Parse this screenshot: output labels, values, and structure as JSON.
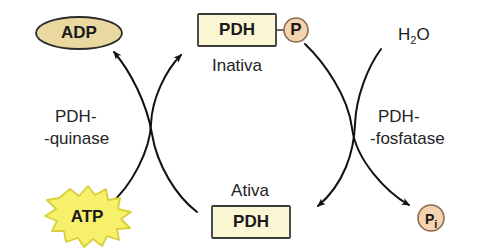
{
  "diagram": {
    "language": "pt-BR",
    "background_color": "#ffffff",
    "nodes": {
      "adp": {
        "label": "ADP",
        "shape": "ellipse",
        "fill": "#e9d8a0",
        "stroke": "#2b2b2b"
      },
      "atp": {
        "label": "ATP",
        "shape": "starburst",
        "fill": "#f7f06a",
        "stroke": "#d8cf3a"
      },
      "pdh_inactive": {
        "label": "PDH",
        "shape": "rect",
        "fill": "#fbf6d4",
        "stroke": "#3a3a3a"
      },
      "pdh_active": {
        "label": "PDH",
        "shape": "rect",
        "fill": "#fbf6d4",
        "stroke": "#3a3a3a"
      },
      "phosphate_group": {
        "label": "P",
        "shape": "circle",
        "fill": "#f5d3b0",
        "stroke": "#8a6a50"
      },
      "inorganic_phosphate": {
        "label": "P",
        "subscript": "i",
        "shape": "circle",
        "fill": "#f5d3b0",
        "stroke": "#8a6a50"
      },
      "water": {
        "label": "H",
        "subscript": "2",
        "label_tail": "O",
        "shape": "text"
      }
    },
    "state_labels": {
      "inactive": "Inativa",
      "active": "Ativa"
    },
    "enzymes": {
      "kinase": {
        "line1": "PDH-",
        "line2": "-quinase"
      },
      "phosphatase": {
        "line1": "PDH-",
        "line2": "-fosfatase"
      }
    }
  }
}
